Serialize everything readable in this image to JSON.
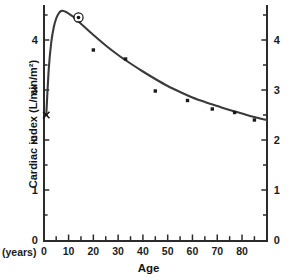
{
  "chart_data": {
    "type": "line",
    "title": "",
    "xlabel": "Age",
    "ylabel": "Cardiac index (L/min/m²)",
    "x_unit_label": "(years)",
    "xlim": [
      0,
      90
    ],
    "ylim": [
      0,
      4.7
    ],
    "grid": false,
    "legend": "none",
    "x_ticks_major": [
      0,
      10,
      20,
      30,
      40,
      50,
      60,
      70,
      80
    ],
    "x_ticks_major_labels": [
      "0",
      "10",
      "20",
      "30",
      "40",
      "50",
      "60",
      "70",
      "80"
    ],
    "x_ticks_minor": [
      5,
      15,
      25,
      35,
      45,
      55,
      65,
      75,
      85
    ],
    "y_ticks_major": [
      0,
      1,
      2,
      3,
      4
    ],
    "y_ticks_major_labels": [
      "0",
      "1",
      "2",
      "3",
      "4"
    ],
    "y_ticks_minor": [
      0.5,
      1.5,
      2.5,
      3.5,
      4.5
    ],
    "right_axis_ticks_major_labels": [
      "0",
      "1",
      "2",
      "3",
      "4"
    ],
    "series": [
      {
        "name": "fitted curve",
        "type": "line",
        "x": [
          1,
          2,
          3,
          4,
          5,
          6,
          7,
          8,
          9,
          10,
          12,
          14,
          16,
          18,
          20,
          25,
          30,
          35,
          40,
          45,
          50,
          55,
          60,
          65,
          70,
          75,
          80,
          85,
          90
        ],
        "y": [
          2.5,
          3.42,
          3.95,
          4.25,
          4.43,
          4.53,
          4.58,
          4.58,
          4.56,
          4.53,
          4.46,
          4.37,
          4.28,
          4.19,
          4.1,
          3.89,
          3.7,
          3.53,
          3.37,
          3.22,
          3.08,
          2.96,
          2.85,
          2.76,
          2.68,
          2.6,
          2.53,
          2.46,
          2.4
        ]
      },
      {
        "name": "measured points",
        "type": "scatter",
        "points": [
          {
            "x": 20,
            "y": 3.8
          },
          {
            "x": 33,
            "y": 3.62
          },
          {
            "x": 45,
            "y": 2.98
          },
          {
            "x": 58,
            "y": 2.79
          },
          {
            "x": 68,
            "y": 2.62
          },
          {
            "x": 77,
            "y": 2.55
          },
          {
            "x": 85,
            "y": 2.4
          }
        ]
      }
    ],
    "annotations": [
      {
        "name": "birth-x-marker",
        "symbol": "x",
        "x": 1,
        "y": 2.5
      },
      {
        "name": "circled-dot-marker",
        "symbol": "circled-dot",
        "x": 14,
        "y": 4.45
      }
    ]
  },
  "axes": {
    "x_title": "Age",
    "y_title": "Cardiac index (L/min/m²)",
    "x_prefix": "(years)"
  }
}
